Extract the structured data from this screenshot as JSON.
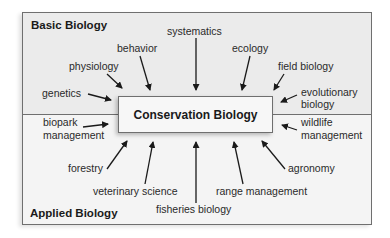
{
  "diagram": {
    "center": "Conservation Biology",
    "sections": {
      "top": "Basic Biology",
      "bottom": "Applied Biology"
    },
    "basic_fields": {
      "systematics": "systematics",
      "behavior": "behavior",
      "ecology": "ecology",
      "physiology": "physiology",
      "field_biology": "field biology",
      "genetics": "genetics",
      "evolutionary_biology_1": "evolutionary",
      "evolutionary_biology_2": "biology"
    },
    "applied_fields": {
      "biopark_management_1": "biopark",
      "biopark_management_2": "management",
      "wildlife_management_1": "wildlife",
      "wildlife_management_2": "management",
      "forestry": "forestry",
      "agronomy": "agronomy",
      "veterinary_science": "veterinary science",
      "range_management": "range management",
      "fisheries_biology": "fisheries biology"
    },
    "colors": {
      "top_bg": "#ebebeb",
      "bottom_bg": "#f4f4f4",
      "border": "#6f6f6f",
      "arrow": "#1a1a1a"
    }
  }
}
